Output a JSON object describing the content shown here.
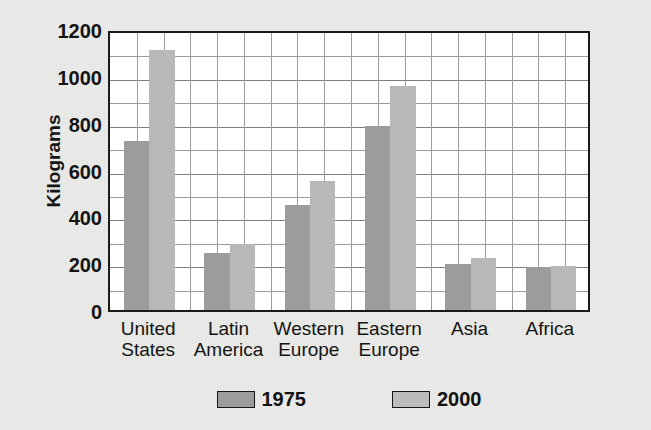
{
  "chart_data": {
    "type": "bar",
    "title": "",
    "xlabel": "",
    "ylabel": "Kilograms",
    "ylim": [
      0,
      1200
    ],
    "ytick_step": 200,
    "minor_gridline_step": 100,
    "grid": true,
    "legend_position": "bottom-center",
    "categories": [
      "United\nStates",
      "Latin\nAmerica",
      "Western\nEurope",
      "Eastern\nEurope",
      "Asia",
      "Africa"
    ],
    "category_labels_flat": [
      "United States",
      "Latin America",
      "Western Europe",
      "Eastern Europe",
      "Asia",
      "Africa"
    ],
    "ytick_labels": [
      "1200",
      "1000",
      "800",
      "600",
      "400",
      "200",
      "0"
    ],
    "ytick_values": [
      1200,
      1000,
      800,
      600,
      400,
      200,
      0
    ],
    "series": [
      {
        "name": "1975",
        "color": "#9c9c9c",
        "values": [
          720,
          245,
          450,
          785,
          195,
          185
        ]
      },
      {
        "name": "2000",
        "color": "#b8b8b8",
        "values": [
          1110,
          280,
          550,
          955,
          220,
          190
        ]
      }
    ]
  },
  "legend": {
    "entries": [
      {
        "label": "1975"
      },
      {
        "label": "2000"
      }
    ]
  },
  "colors": {
    "background": "#e9e9e7",
    "plot_background": "#ffffff",
    "axis": "#1a1a1a",
    "gridline": "#9d9d9d",
    "series_1975": "#9c9c9c",
    "series_2000": "#b8b8b8",
    "text": "#141414"
  }
}
